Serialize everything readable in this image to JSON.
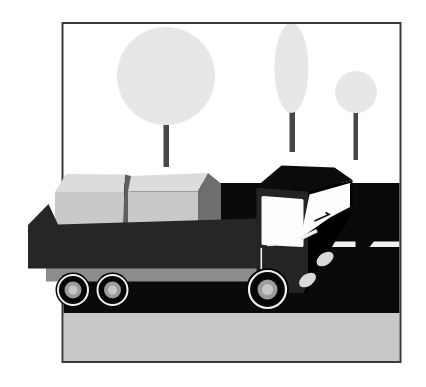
{
  "scene": {
    "kind": "vector-clipart-illustration",
    "subject": "cargo truck loaded with two crates on a dark road, three pale trees behind, inside a thin rectangular frame",
    "objects": [
      "picture-frame",
      "sky",
      "large-round-tree",
      "tall-cypress-tree",
      "small-round-tree",
      "road",
      "road-center-line",
      "ground-strip",
      "truck-bed",
      "cargo-box-left",
      "cargo-box-right",
      "truck-cab",
      "windshield",
      "side-window",
      "headlights",
      "rear-wheels",
      "front-wheel"
    ]
  },
  "colors": {
    "background": "#ffffff",
    "frame_border": "#3a3a3a",
    "sky": "#ffffff",
    "foliage": "#e7e7e7",
    "trunk": "#474747",
    "road": "#0a0a0a",
    "road_marking": "#f2f2f2",
    "ground": "#c8c8c8",
    "chassis": "#8c8c8c",
    "box_top": "#dcdcdc",
    "box_front": "#c9c9c9",
    "box_side": "#6e6e6e",
    "box_divider": "#5f5f5f",
    "truck_bed": "#262626",
    "cab_side": "#242424",
    "cab_roof": "#0b0b0b",
    "cab_front": "#000000",
    "glass": "#fdfdfd",
    "detail_white": "#efefef",
    "wiper": "#111111",
    "headlight": "#d9d9d9",
    "tire": "#060606",
    "rim": "#f0f0f0",
    "hub": "#9b9b9b",
    "hub_cap": "#c6c6c6"
  }
}
